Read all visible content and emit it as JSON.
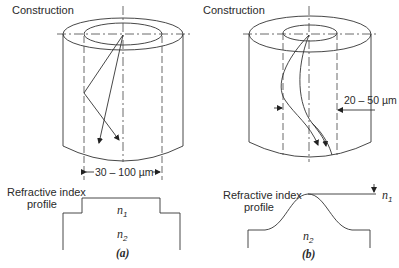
{
  "figure": {
    "panel_a": {
      "construction_label": "Construction",
      "dimension_label": "30 – 100 µm",
      "profile_label_line1": "Refractive index",
      "profile_label_line2": "profile",
      "n1_label": "n",
      "n1_sub": "1",
      "n2_label": "n",
      "n2_sub": "2",
      "caption": "(a)",
      "profile_type": "step-index"
    },
    "panel_b": {
      "construction_label": "Construction",
      "dimension_label": "20 – 50 µm",
      "profile_label_line1": "Refractive index",
      "profile_label_line2": "profile",
      "n1_label": "n",
      "n1_sub": "1",
      "n2_label": "n",
      "n2_sub": "2",
      "caption": "(b)",
      "profile_type": "graded-index"
    },
    "colors": {
      "line": "#333333",
      "text": "#2a2a2a",
      "background": "#ffffff"
    }
  }
}
